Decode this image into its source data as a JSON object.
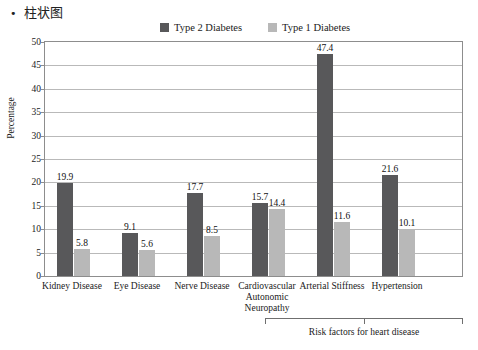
{
  "heading": {
    "bullet": "•",
    "text": "柱状图"
  },
  "chart_data": {
    "type": "bar",
    "title": "",
    "xlabel": "",
    "ylabel": "Percentage",
    "ylim": [
      0,
      50
    ],
    "ytick_step": 5,
    "yticks": [
      "0",
      "5",
      "10",
      "15",
      "20",
      "25",
      "30",
      "35",
      "40",
      "45",
      "50"
    ],
    "grid": "horizontal",
    "legend_position": "top-center",
    "categories": [
      "Kidney Disease",
      "Eye Disease",
      "Nerve Disease",
      "Cardiovascular Autonomic Neuropathy",
      "Arterial Stiffness",
      "Hypertension"
    ],
    "category_lines": [
      [
        "Kidney Disease"
      ],
      [
        "Eye Disease"
      ],
      [
        "Nerve Disease"
      ],
      [
        "Cardiovascular",
        "Autonomic",
        "Neuropathy"
      ],
      [
        "Arterial Stiffness"
      ],
      [
        "Hypertension"
      ]
    ],
    "series": [
      {
        "name": "Type 2 Diabetes",
        "color": "#58585a",
        "values": [
          19.9,
          9.1,
          17.7,
          15.7,
          47.4,
          21.6
        ],
        "labels": [
          "19.9",
          "9.1",
          "17.7",
          "15.7",
          "47.4",
          "21.6"
        ]
      },
      {
        "name": "Type 1 Diabetes",
        "color": "#b8b8b8",
        "values": [
          5.8,
          5.6,
          8.5,
          14.4,
          11.6,
          10.1
        ],
        "labels": [
          "5.8",
          "5.6",
          "8.5",
          "14.4",
          "11.6",
          "10.1"
        ]
      }
    ],
    "annotation": {
      "bracket_label": "Risk factors for heart disease",
      "bracket_covers": [
        "Cardiovascular Autonomic Neuropathy",
        "Arterial Stiffness",
        "Hypertension"
      ]
    }
  }
}
